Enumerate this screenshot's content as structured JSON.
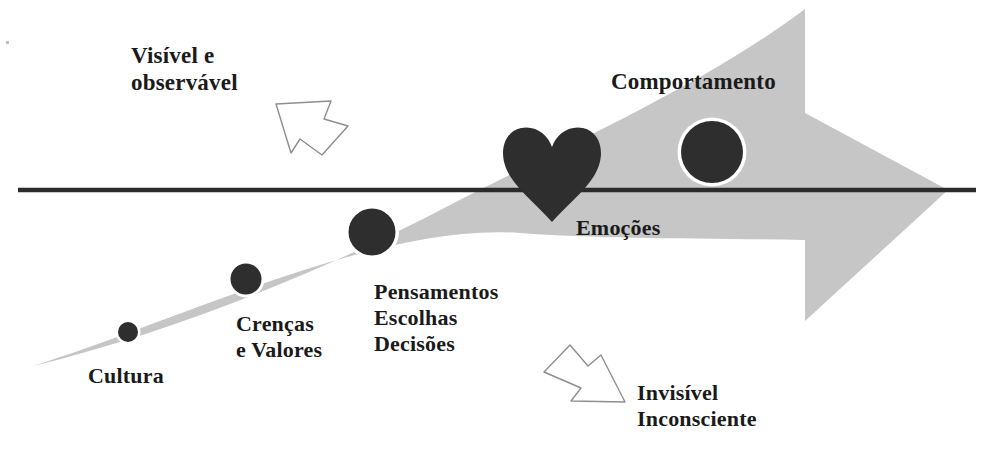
{
  "diagram": {
    "colors": {
      "band_gray": "#c6c6c6",
      "marker_dark": "#2e2e2e",
      "marker_ring": "#ffffff",
      "waterline": "#2b2b2b",
      "text": "#1a1a1a",
      "outline_arrow_stroke": "#8e8e8e",
      "background": "#ffffff"
    },
    "annotations": {
      "above_line": {
        "label": "Visível e\nobservável",
        "line1": "Visível e",
        "line2": "observável",
        "arrow_icon": "arrow-up-left-outline"
      },
      "below_line": {
        "label": "Invisível\nInconsciente",
        "line1": "Invisível",
        "line2": "Inconsciente",
        "arrow_icon": "arrow-down-right-outline"
      }
    },
    "stages": [
      {
        "id": "cultura",
        "label": "Cultura",
        "marker": "circle",
        "marker_radius": 11,
        "zone": "below-line"
      },
      {
        "id": "crencas",
        "label": "Crenças\ne Valores",
        "marker": "circle",
        "marker_radius": 16,
        "zone": "below-line"
      },
      {
        "id": "pensamentos",
        "label": "Pensamentos\nEscolhas\nDecisões",
        "marker": "circle",
        "marker_radius": 24,
        "zone": "below-line"
      },
      {
        "id": "emocoes",
        "label": "Emoções",
        "marker": "heart",
        "marker_radius": 48,
        "zone": "on-line"
      },
      {
        "id": "comportamento",
        "label": "Comportamento",
        "marker": "circle",
        "marker_radius": 31,
        "zone": "above-line"
      }
    ],
    "stage_labels": {
      "cultura": "Cultura",
      "crencas_l1": "Crenças",
      "crencas_l2": "e Valores",
      "pensamentos_l1": "Pensamentos",
      "pensamentos_l2": "Escolhas",
      "pensamentos_l3": "Decisões",
      "emocoes": "Emoções",
      "comportamento": "Comportamento"
    },
    "waterline": {
      "label": "water-line",
      "x_start": 18,
      "x_end": 976,
      "y": 190,
      "thickness": 4
    }
  }
}
